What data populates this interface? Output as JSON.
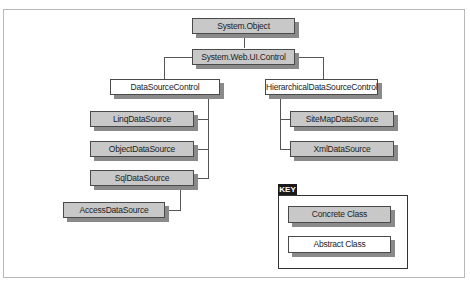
{
  "diagram": {
    "title": "",
    "nodes": {
      "system_object": {
        "label": "System.Object",
        "kind": "concrete"
      },
      "system_web_ui_control": {
        "label": "System.Web.UI.Control",
        "kind": "concrete"
      },
      "datasource_control": {
        "label": "DataSourceControl",
        "kind": "abstract"
      },
      "hierarchical_datasource_control": {
        "label": "HierarchicalDataSourceControl",
        "kind": "abstract"
      },
      "linq_datasource": {
        "label": "LinqDataSource",
        "kind": "concrete"
      },
      "object_datasource": {
        "label": "ObjectDataSource",
        "kind": "concrete"
      },
      "sql_datasource": {
        "label": "SqlDataSource",
        "kind": "concrete"
      },
      "access_datasource": {
        "label": "AccessDataSource",
        "kind": "concrete"
      },
      "sitemap_datasource": {
        "label": "SiteMapDataSource",
        "kind": "concrete"
      },
      "xml_datasource": {
        "label": "XmlDataSource",
        "kind": "concrete"
      }
    },
    "edges": [
      [
        "system_object",
        "system_web_ui_control"
      ],
      [
        "system_web_ui_control",
        "datasource_control"
      ],
      [
        "system_web_ui_control",
        "hierarchical_datasource_control"
      ],
      [
        "datasource_control",
        "linq_datasource"
      ],
      [
        "datasource_control",
        "object_datasource"
      ],
      [
        "datasource_control",
        "sql_datasource"
      ],
      [
        "sql_datasource",
        "access_datasource"
      ],
      [
        "hierarchical_datasource_control",
        "sitemap_datasource"
      ],
      [
        "hierarchical_datasource_control",
        "xml_datasource"
      ]
    ]
  },
  "key": {
    "title": "KEY",
    "concrete_label": "Concrete Class",
    "abstract_label": "Abstract Class"
  },
  "colors": {
    "concrete_fill": "#c8c8c8",
    "abstract_fill": "#ffffff",
    "shadow": "#8a8a8a"
  }
}
